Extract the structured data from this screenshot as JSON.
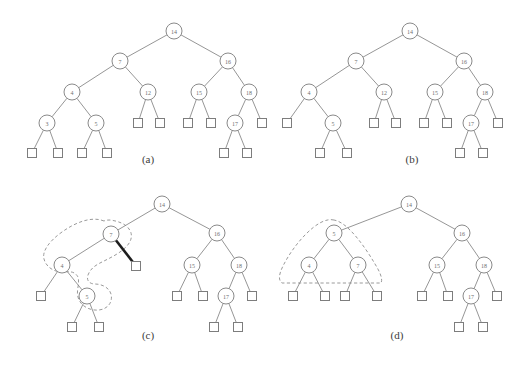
{
  "figure": {
    "width": 532,
    "height": 369,
    "background_color": "#ffffff",
    "node_stroke_color": "#8a8a8a",
    "node_fill_color": "#ffffff",
    "label_color": "#6f6f6f",
    "edge_color": "#8a8a8a",
    "highlight_edge_color": "#1d1d1d",
    "dashed_region_color": "#9a9a9a",
    "caption_color": "#3b3b3b",
    "node_radius": 8,
    "leaf_size": 9
  },
  "panels": [
    {
      "id": "a",
      "caption": "(a)",
      "caption_x": 148,
      "caption_y": 163,
      "nodes": [
        {
          "id": "a14",
          "label": "14",
          "x": 174,
          "y": 31
        },
        {
          "id": "a7",
          "label": "7",
          "x": 120,
          "y": 61
        },
        {
          "id": "a16",
          "label": "16",
          "x": 228,
          "y": 61
        },
        {
          "id": "a4",
          "label": "4",
          "x": 72,
          "y": 92
        },
        {
          "id": "a12",
          "label": "12",
          "x": 148,
          "y": 92
        },
        {
          "id": "a15",
          "label": "15",
          "x": 199,
          "y": 92
        },
        {
          "id": "a18",
          "label": "18",
          "x": 249,
          "y": 92
        },
        {
          "id": "a3",
          "label": "3",
          "x": 47,
          "y": 123
        },
        {
          "id": "a5",
          "label": "5",
          "x": 96,
          "y": 123
        },
        {
          "id": "a17",
          "label": "17",
          "x": 235,
          "y": 123
        }
      ],
      "leaves": [
        {
          "id": "al1",
          "x": 138,
          "y": 123
        },
        {
          "id": "al2",
          "x": 160,
          "y": 123
        },
        {
          "id": "al3",
          "x": 188,
          "y": 123
        },
        {
          "id": "al4",
          "x": 211,
          "y": 123
        },
        {
          "id": "al5",
          "x": 262,
          "y": 123
        },
        {
          "id": "al6",
          "x": 32,
          "y": 153
        },
        {
          "id": "al7",
          "x": 58,
          "y": 153
        },
        {
          "id": "al8",
          "x": 82,
          "y": 153
        },
        {
          "id": "al9",
          "x": 107,
          "y": 153
        },
        {
          "id": "al10",
          "x": 224,
          "y": 153
        },
        {
          "id": "al11",
          "x": 247,
          "y": 153
        }
      ],
      "edges": [
        [
          "a14",
          "a7"
        ],
        [
          "a14",
          "a16"
        ],
        [
          "a7",
          "a4"
        ],
        [
          "a7",
          "a12"
        ],
        [
          "a16",
          "a15"
        ],
        [
          "a16",
          "a18"
        ],
        [
          "a4",
          "a3"
        ],
        [
          "a4",
          "a5"
        ],
        [
          "a12",
          "al1"
        ],
        [
          "a12",
          "al2"
        ],
        [
          "a15",
          "al3"
        ],
        [
          "a15",
          "al4"
        ],
        [
          "a18",
          "a17"
        ],
        [
          "a18",
          "al5"
        ],
        [
          "a3",
          "al6"
        ],
        [
          "a3",
          "al7"
        ],
        [
          "a5",
          "al8"
        ],
        [
          "a5",
          "al9"
        ],
        [
          "a17",
          "al10"
        ],
        [
          "a17",
          "al11"
        ]
      ],
      "thick_edges": [],
      "dashed_regions": []
    },
    {
      "id": "b",
      "caption": "(b)",
      "caption_x": 412,
      "caption_y": 163,
      "nodes": [
        {
          "id": "b14",
          "label": "14",
          "x": 410,
          "y": 31
        },
        {
          "id": "b7",
          "label": "7",
          "x": 356,
          "y": 61
        },
        {
          "id": "b16",
          "label": "16",
          "x": 464,
          "y": 61
        },
        {
          "id": "b4",
          "label": "4",
          "x": 309,
          "y": 92
        },
        {
          "id": "b12",
          "label": "12",
          "x": 384,
          "y": 92
        },
        {
          "id": "b15",
          "label": "15",
          "x": 435,
          "y": 92
        },
        {
          "id": "b18",
          "label": "18",
          "x": 485,
          "y": 92
        },
        {
          "id": "b5",
          "label": "5",
          "x": 333,
          "y": 123
        },
        {
          "id": "b17",
          "label": "17",
          "x": 471,
          "y": 123
        }
      ],
      "leaves": [
        {
          "id": "bl1",
          "x": 287,
          "y": 123
        },
        {
          "id": "bl2",
          "x": 374,
          "y": 123
        },
        {
          "id": "bl3",
          "x": 396,
          "y": 123
        },
        {
          "id": "bl4",
          "x": 424,
          "y": 123
        },
        {
          "id": "bl5",
          "x": 447,
          "y": 123
        },
        {
          "id": "bl6",
          "x": 498,
          "y": 123
        },
        {
          "id": "bl7",
          "x": 320,
          "y": 153
        },
        {
          "id": "bl8",
          "x": 347,
          "y": 153
        },
        {
          "id": "bl9",
          "x": 460,
          "y": 153
        },
        {
          "id": "bl10",
          "x": 483,
          "y": 153
        }
      ],
      "edges": [
        [
          "b14",
          "b7"
        ],
        [
          "b14",
          "b16"
        ],
        [
          "b7",
          "b4"
        ],
        [
          "b7",
          "b12"
        ],
        [
          "b16",
          "b15"
        ],
        [
          "b16",
          "b18"
        ],
        [
          "b4",
          "bl1"
        ],
        [
          "b4",
          "b5"
        ],
        [
          "b12",
          "bl2"
        ],
        [
          "b12",
          "bl3"
        ],
        [
          "b15",
          "bl4"
        ],
        [
          "b15",
          "bl5"
        ],
        [
          "b18",
          "b17"
        ],
        [
          "b18",
          "bl6"
        ],
        [
          "b5",
          "bl7"
        ],
        [
          "b5",
          "bl8"
        ],
        [
          "b17",
          "bl9"
        ],
        [
          "b17",
          "bl10"
        ]
      ],
      "thick_edges": [],
      "dashed_regions": []
    },
    {
      "id": "c",
      "caption": "(c)",
      "caption_x": 148,
      "caption_y": 339,
      "nodes": [
        {
          "id": "c14",
          "label": "14",
          "x": 162,
          "y": 204
        },
        {
          "id": "c7",
          "label": "7",
          "x": 111,
          "y": 234
        },
        {
          "id": "c16",
          "label": "16",
          "x": 217,
          "y": 233
        },
        {
          "id": "c4",
          "label": "4",
          "x": 62,
          "y": 265
        },
        {
          "id": "c15",
          "label": "15",
          "x": 192,
          "y": 265
        },
        {
          "id": "c18",
          "label": "18",
          "x": 239,
          "y": 265
        },
        {
          "id": "c5",
          "label": "5",
          "x": 87,
          "y": 296
        },
        {
          "id": "c17",
          "label": "17",
          "x": 226,
          "y": 296
        }
      ],
      "leaves": [
        {
          "id": "cl1",
          "x": 136,
          "y": 266
        },
        {
          "id": "cl2",
          "x": 41,
          "y": 296
        },
        {
          "id": "cl3",
          "x": 177,
          "y": 296
        },
        {
          "id": "cl4",
          "x": 203,
          "y": 296
        },
        {
          "id": "cl5",
          "x": 252,
          "y": 296
        },
        {
          "id": "cl6",
          "x": 72,
          "y": 327
        },
        {
          "id": "cl7",
          "x": 99,
          "y": 327
        },
        {
          "id": "cl8",
          "x": 214,
          "y": 327
        },
        {
          "id": "cl9",
          "x": 238,
          "y": 327
        }
      ],
      "edges": [
        [
          "c14",
          "c7"
        ],
        [
          "c14",
          "c16"
        ],
        [
          "c7",
          "c4"
        ],
        [
          "c16",
          "c15"
        ],
        [
          "c16",
          "c18"
        ],
        [
          "c4",
          "cl2"
        ],
        [
          "c4",
          "c5"
        ],
        [
          "c15",
          "cl3"
        ],
        [
          "c15",
          "cl4"
        ],
        [
          "c18",
          "c17"
        ],
        [
          "c18",
          "cl5"
        ],
        [
          "c5",
          "cl6"
        ],
        [
          "c5",
          "cl7"
        ],
        [
          "c17",
          "cl8"
        ],
        [
          "c17",
          "cl9"
        ]
      ],
      "thick_edges": [
        [
          "c7",
          "cl1"
        ]
      ],
      "dashed_regions": [
        "M 104 221 C 92 216 76 222 62 232 C 48 242 42 252 44 259 C 46 267 54 272 62 272 C 68 272 74 270 78 277 C 80 284 76 290 78 297 C 80 306 90 311 99 310 C 108 309 113 302 111 294 C 109 287 101 284 95 284 C 90 284 86 281 88 275 C 91 267 98 264 104 261 C 112 257 120 253 126 247 C 132 241 133 234 129 229 C 126 224 118 221 110 220 C 108 220 106 220 104 221 Z"
      ]
    },
    {
      "id": "d",
      "caption": "(d)",
      "caption_x": 397,
      "caption_y": 339,
      "nodes": [
        {
          "id": "d14",
          "label": "14",
          "x": 409,
          "y": 204
        },
        {
          "id": "d5",
          "label": "5",
          "x": 334,
          "y": 233
        },
        {
          "id": "d16",
          "label": "16",
          "x": 462,
          "y": 233
        },
        {
          "id": "d4",
          "label": "4",
          "x": 309,
          "y": 265
        },
        {
          "id": "d7",
          "label": "7",
          "x": 358,
          "y": 265
        },
        {
          "id": "d15",
          "label": "15",
          "x": 437,
          "y": 265
        },
        {
          "id": "d18",
          "label": "18",
          "x": 484,
          "y": 265
        },
        {
          "id": "d17",
          "label": "17",
          "x": 471,
          "y": 296
        }
      ],
      "leaves": [
        {
          "id": "dl1",
          "x": 293,
          "y": 296
        },
        {
          "id": "dl2",
          "x": 325,
          "y": 296
        },
        {
          "id": "dl3",
          "x": 345,
          "y": 296
        },
        {
          "id": "dl4",
          "x": 377,
          "y": 296
        },
        {
          "id": "dl5",
          "x": 422,
          "y": 296
        },
        {
          "id": "dl6",
          "x": 448,
          "y": 296
        },
        {
          "id": "dl7",
          "x": 497,
          "y": 296
        },
        {
          "id": "dl8",
          "x": 459,
          "y": 327
        },
        {
          "id": "dl9",
          "x": 483,
          "y": 327
        }
      ],
      "edges": [
        [
          "d14",
          "d5"
        ],
        [
          "d14",
          "d16"
        ],
        [
          "d5",
          "d4"
        ],
        [
          "d5",
          "d7"
        ],
        [
          "d16",
          "d15"
        ],
        [
          "d16",
          "d18"
        ],
        [
          "d4",
          "dl1"
        ],
        [
          "d4",
          "dl2"
        ],
        [
          "d7",
          "dl3"
        ],
        [
          "d7",
          "dl4"
        ],
        [
          "d15",
          "dl5"
        ],
        [
          "d15",
          "dl6"
        ],
        [
          "d18",
          "d17"
        ],
        [
          "d18",
          "dl7"
        ],
        [
          "d17",
          "dl8"
        ],
        [
          "d17",
          "dl9"
        ]
      ],
      "thick_edges": [],
      "dashed_regions": [
        "M 334 220 C 326 218 316 224 306 234 C 296 244 288 256 283 266 C 279 274 278 280 282 283 L 381 283 C 383 279 380 272 375 264 C 368 252 359 239 350 230 C 344 224 339 221 334 220 Z"
      ]
    }
  ]
}
